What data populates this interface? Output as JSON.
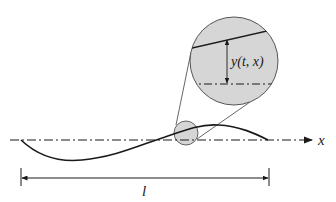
{
  "diagram": {
    "type": "string-displacement",
    "labels": {
      "axis": "x",
      "length": "l",
      "displacement": "y(t, x)"
    },
    "colors": {
      "line": "#1a1a1a",
      "circle_fill": "#d6d6d6",
      "circle_stroke": "#555555",
      "background": "#ffffff"
    },
    "geometry": {
      "axis_y": 140,
      "axis_x_start": 10,
      "axis_x_end": 314,
      "string_start_x": 21,
      "string_end_x": 268,
      "magnifier_small": {
        "cx": 186,
        "cy": 133,
        "r": 12
      },
      "magnifier_large": {
        "cx": 234,
        "cy": 61,
        "r": 44
      },
      "dimension_y": 178
    }
  }
}
